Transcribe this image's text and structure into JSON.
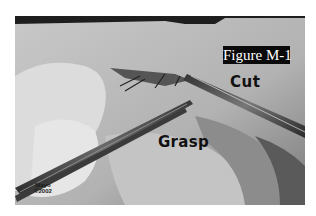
{
  "figure": {
    "label": "Figure M-1"
  },
  "annotations": {
    "cut": "Cut",
    "grasp": "Grasp"
  },
  "watermark": {
    "line1": "Mayo",
    "line2": "©2002"
  },
  "colors": {
    "label_background": "#0a0a0a",
    "label_text": "#ffffff",
    "annotation_text": "#111111",
    "photo_base": "#b9b9b9"
  }
}
